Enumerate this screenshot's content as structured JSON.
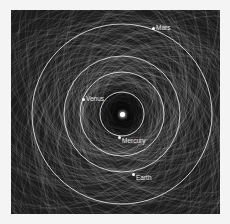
{
  "figure": {
    "background_color": "#1c1c1c",
    "page_color": "#f4f4f4",
    "sun": {
      "x": 111,
      "y": 104
    },
    "planets": [
      {
        "name": "Mercury",
        "orbit_radius": 22,
        "dot": {
          "x": 108,
          "y": 127
        },
        "label_offset": {
          "x": 3,
          "y": 0
        }
      },
      {
        "name": "Venus",
        "orbit_radius": 42,
        "dot": {
          "x": 72,
          "y": 89
        },
        "label_offset": {
          "x": 3,
          "y": -4
        }
      },
      {
        "name": "Earth",
        "orbit_radius": 58,
        "dot": {
          "x": 122,
          "y": 164
        },
        "label_offset": {
          "x": 3,
          "y": 0
        }
      },
      {
        "name": "Mars",
        "orbit_radius": 90,
        "dot": {
          "x": 142,
          "y": 18
        },
        "label_offset": {
          "x": 3,
          "y": -4
        }
      }
    ],
    "asteroid_orbits": {
      "count": 260,
      "seed": 7,
      "min_a": 20,
      "max_a": 150,
      "stroke": "#d0d0d0",
      "opacity": 0.18
    }
  }
}
